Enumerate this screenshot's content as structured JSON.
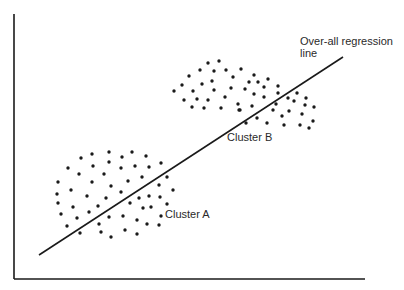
{
  "figure": {
    "regression_label_line1": "Over-all regression",
    "regression_label_line2": "line",
    "cluster_a_label": "Cluster A",
    "cluster_b_label": "Cluster B",
    "ink_color": "#1a1a1a"
  },
  "chart_data": {
    "type": "scatter",
    "title": "",
    "xlabel": "",
    "ylabel": "",
    "grid": false,
    "annotations": [
      "Over-all regression line",
      "Cluster A",
      "Cluster B"
    ],
    "regression_line": {
      "x1": 39,
      "y1": 255,
      "x2": 343,
      "y2": 57
    },
    "series": [
      {
        "name": "Cluster A",
        "points": [
          [
            81,
            158
          ],
          [
            92,
            154
          ],
          [
            109,
            152
          ],
          [
            122,
            157
          ],
          [
            132,
            152
          ],
          [
            146,
            156
          ],
          [
            68,
            168
          ],
          [
            93,
            166
          ],
          [
            109,
            162
          ],
          [
            121,
            168
          ],
          [
            135,
            166
          ],
          [
            149,
            167
          ],
          [
            161,
            163
          ],
          [
            79,
            174
          ],
          [
            104,
            174
          ],
          [
            58,
            182
          ],
          [
            92,
            182
          ],
          [
            128,
            181
          ],
          [
            142,
            177
          ],
          [
            167,
            177
          ],
          [
            71,
            190
          ],
          [
            111,
            186
          ],
          [
            159,
            185
          ],
          [
            173,
            190
          ],
          [
            57,
            194
          ],
          [
            87,
            196
          ],
          [
            106,
            198
          ],
          [
            121,
            192
          ],
          [
            58,
            203
          ],
          [
            73,
            207
          ],
          [
            98,
            206
          ],
          [
            130,
            203
          ],
          [
            139,
            198
          ],
          [
            149,
            196
          ],
          [
            160,
            197
          ],
          [
            167,
            204
          ],
          [
            143,
            208
          ],
          [
            151,
            207
          ],
          [
            61,
            214
          ],
          [
            77,
            218
          ],
          [
            89,
            212
          ],
          [
            109,
            217
          ],
          [
            123,
            216
          ],
          [
            137,
            220
          ],
          [
            161,
            216
          ],
          [
            67,
            226
          ],
          [
            80,
            233
          ],
          [
            99,
            224
          ],
          [
            101,
            232
          ],
          [
            111,
            237
          ],
          [
            125,
            230
          ],
          [
            137,
            234
          ],
          [
            147,
            224
          ],
          [
            159,
            225
          ]
        ]
      },
      {
        "name": "Cluster B",
        "points": [
          [
            208,
            63
          ],
          [
            219,
            61
          ],
          [
            200,
            70
          ],
          [
            214,
            71
          ],
          [
            226,
            70
          ],
          [
            241,
            69
          ],
          [
            189,
            76
          ],
          [
            233,
            77
          ],
          [
            182,
            85
          ],
          [
            202,
            84
          ],
          [
            212,
            81
          ],
          [
            174,
            91
          ],
          [
            193,
            91
          ],
          [
            214,
            90
          ],
          [
            231,
            88
          ],
          [
            184,
            100
          ],
          [
            197,
            99
          ],
          [
            208,
            100
          ],
          [
            225,
            97
          ],
          [
            192,
            107
          ],
          [
            204,
            108
          ],
          [
            221,
            108
          ],
          [
            238,
            104
          ],
          [
            239,
            110
          ],
          [
            254,
            75
          ],
          [
            268,
            79
          ],
          [
            249,
            82
          ],
          [
            258,
            82
          ],
          [
            278,
            86
          ],
          [
            245,
            89
          ],
          [
            264,
            87
          ],
          [
            254,
            94
          ],
          [
            264,
            97
          ],
          [
            278,
            93
          ],
          [
            297,
            93
          ],
          [
            288,
            98
          ],
          [
            294,
            101
          ],
          [
            306,
            98
          ],
          [
            252,
            106
          ],
          [
            276,
            104
          ],
          [
            305,
            105
          ],
          [
            314,
            107
          ],
          [
            240,
            110
          ],
          [
            273,
            110
          ],
          [
            289,
            111
          ],
          [
            302,
            114
          ],
          [
            257,
            118
          ],
          [
            282,
            116
          ],
          [
            313,
            121
          ],
          [
            246,
            123
          ],
          [
            267,
            123
          ],
          [
            284,
            125
          ],
          [
            300,
            125
          ],
          [
            309,
            128
          ]
        ]
      }
    ],
    "axes": {
      "origin": [
        14,
        279
      ],
      "y_top": 14,
      "x_right": 365
    }
  }
}
